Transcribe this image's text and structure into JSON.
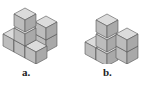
{
  "figures": [
    {
      "label": "a.",
      "description": "isometric stack of cubes a"
    },
    {
      "label": "b.",
      "description": "isometric stack of cubes b"
    }
  ],
  "colors": {
    "top": "#dcdcdc",
    "left": "#bdbdbd",
    "right": "#a9a9a9",
    "edge": "#555555"
  }
}
